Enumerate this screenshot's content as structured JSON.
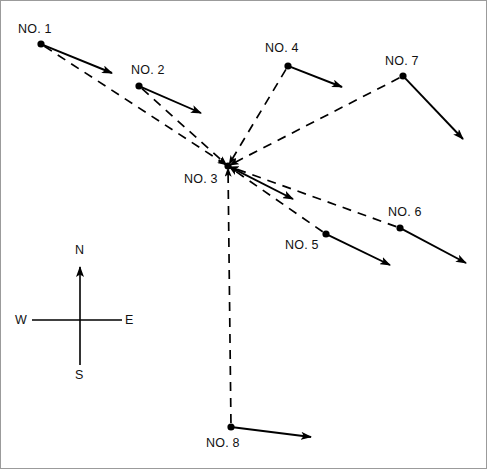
{
  "figure": {
    "width": 488,
    "height": 470,
    "background": "#ffffff",
    "stroke_color": "#000000",
    "frame_color": "#9b9b9b",
    "type": "radial-network-vector-diagram"
  },
  "hub": {
    "id": "NO. 3",
    "label": "NO. 3",
    "x": 228,
    "y": 166,
    "label_x": 184,
    "label_y": 172
  },
  "nodes": [
    {
      "id": "no1",
      "label": "NO. 1",
      "x": 41,
      "y": 44,
      "label_x": 18,
      "label_y": 22,
      "arrow_to_x": 112,
      "arrow_to_y": 73,
      "spoke": true
    },
    {
      "id": "no2",
      "label": "NO. 2",
      "x": 139,
      "y": 86,
      "label_x": 131,
      "label_y": 63,
      "arrow_to_x": 201,
      "arrow_to_y": 113,
      "spoke": true
    },
    {
      "id": "no3",
      "label": "NO. 3",
      "x": 228,
      "y": 166,
      "label_x": 184,
      "label_y": 172,
      "arrow_to_x": 293,
      "arrow_to_y": 199,
      "spoke": false
    },
    {
      "id": "no4",
      "label": "NO. 4",
      "x": 288,
      "y": 66,
      "label_x": 265,
      "label_y": 41,
      "arrow_to_x": 342,
      "arrow_to_y": 87,
      "spoke": true
    },
    {
      "id": "no5",
      "label": "NO. 5",
      "x": 326,
      "y": 234,
      "label_x": 285,
      "label_y": 238,
      "arrow_to_x": 390,
      "arrow_to_y": 265,
      "spoke": true
    },
    {
      "id": "no6",
      "label": "NO. 6",
      "x": 400,
      "y": 228,
      "label_x": 388,
      "label_y": 205,
      "arrow_to_x": 466,
      "arrow_to_y": 263,
      "spoke": true
    },
    {
      "id": "no7",
      "label": "NO. 7",
      "x": 403,
      "y": 76,
      "label_x": 385,
      "label_y": 54,
      "arrow_to_x": 463,
      "arrow_to_y": 139,
      "spoke": true
    },
    {
      "id": "no8",
      "label": "NO. 8",
      "x": 231,
      "y": 427,
      "label_x": 206,
      "label_y": 436,
      "arrow_to_x": 311,
      "arrow_to_y": 437,
      "spoke": true
    }
  ],
  "compass": {
    "center_x": 80,
    "center_y": 320,
    "north_label": "N",
    "south_label": "S",
    "east_label": "E",
    "west_label": "W",
    "north_tip_x": 80,
    "north_tip_y": 267,
    "south_end_x": 80,
    "south_end_y": 365,
    "east_end_x": 122,
    "east_end_y": 320,
    "west_end_x": 32,
    "west_end_y": 320,
    "n_label_x": 75,
    "n_label_y": 243,
    "s_label_x": 75,
    "s_label_y": 368,
    "e_label_x": 125,
    "e_label_y": 313,
    "w_label_x": 15,
    "w_label_y": 313
  }
}
